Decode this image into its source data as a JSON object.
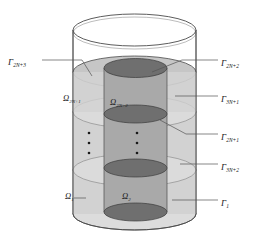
{
  "figure": {
    "type": "geometry-diagram",
    "colors": {
      "outline": "#4a4a4a",
      "outer_region_fill": "#d0d0d0",
      "inner_region_fill": "#a8a8a8",
      "disk_fill": "#787878",
      "top_cap_fill": "#ffffff",
      "leader_line": "#555555",
      "text": "#1a1a1a"
    },
    "labels": {
      "left": [
        {
          "id": "gamma-2n-plus-3",
          "symbol": "Γ",
          "sub": "2N+3",
          "x": 8,
          "y": 55
        },
        {
          "id": "omega-2n-plus-1",
          "symbol": "Ω",
          "sub": "2N+1",
          "x": 63,
          "y": 92
        },
        {
          "id": "omega-1",
          "symbol": "Ω",
          "sub": "1",
          "x": 63,
          "y": 190
        }
      ],
      "center": [
        {
          "id": "omega-2n-plus-2",
          "symbol": "Ω",
          "sub": "2N+2",
          "x": 112,
          "y": 96
        },
        {
          "id": "omega-2",
          "symbol": "Ω",
          "sub": "2",
          "x": 122,
          "y": 190
        }
      ],
      "right": [
        {
          "id": "gamma-2n-plus-2",
          "symbol": "Γ",
          "sub": "2N+2",
          "x": 222,
          "y": 56
        },
        {
          "id": "gamma-3n-plus-1",
          "symbol": "Γ",
          "sub": "3N+1",
          "x": 222,
          "y": 92
        },
        {
          "id": "gamma-2n-plus-1",
          "symbol": "Γ",
          "sub": "2N+1",
          "x": 222,
          "y": 130
        },
        {
          "id": "gamma-3n-plus-2",
          "symbol": "Γ",
          "sub": "3N+2",
          "x": 222,
          "y": 160
        },
        {
          "id": "gamma-1",
          "symbol": "Γ",
          "sub": "1",
          "x": 222,
          "y": 196
        }
      ]
    },
    "ellipsis": {
      "left_column_x": 89,
      "right_column_x": 137,
      "dot_ys": [
        133,
        143,
        153
      ],
      "dot_size": 2.4,
      "dot_color": "#1a1a1a"
    },
    "geometry": {
      "outer_cylinder": {
        "left": 73,
        "right": 196,
        "top_center_y": 30,
        "bottom_center_y": 214,
        "rx": 61.5,
        "ry": 16
      },
      "inner_cylinder": {
        "left": 104,
        "right": 167,
        "rx": 31.5,
        "ry": 9
      },
      "outer_disk_levels_y": [
        72,
        112,
        170,
        214
      ],
      "inner_disk_levels_y": [
        68,
        114,
        168,
        212
      ]
    }
  }
}
